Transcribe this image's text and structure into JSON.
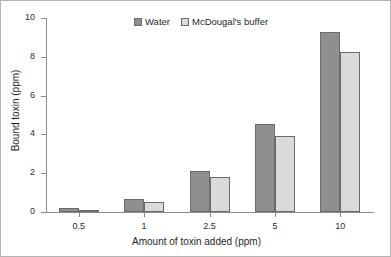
{
  "chart_data": {
    "type": "bar",
    "title": "",
    "subtitle": "",
    "xlabel": "Amount of toxin added (ppm)",
    "ylabel": "Bound toxin (ppm)",
    "categories": [
      "0.5",
      "1",
      "2.5",
      "5",
      "10"
    ],
    "series": [
      {
        "name": "Water",
        "color": "#8f8f8f",
        "values": [
          0.2,
          0.65,
          2.1,
          4.55,
          9.3
        ]
      },
      {
        "name": "McDougal's buffer",
        "color": "#dadada",
        "values": [
          0.12,
          0.5,
          1.8,
          3.9,
          8.25
        ]
      }
    ],
    "ylim": [
      0,
      10
    ],
    "yticks": [
      0,
      2,
      4,
      6,
      8,
      10
    ],
    "ytick_labels": [
      "0",
      "2",
      "4",
      "6",
      "8",
      "10"
    ],
    "grid": false,
    "legend_position": "top-center",
    "annotations": []
  },
  "legend": {
    "items": [
      {
        "label": "Water"
      },
      {
        "label": "McDougal's buffer"
      }
    ]
  }
}
